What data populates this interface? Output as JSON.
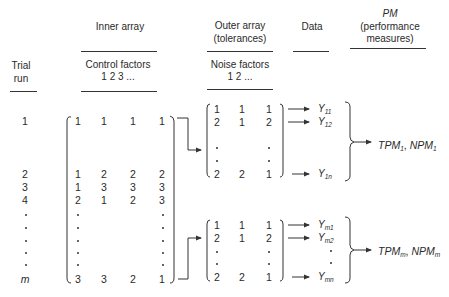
{
  "headers": {
    "inner_array": "Inner array",
    "outer_array_line1": "Outer array",
    "outer_array_line2": "(tolerances)",
    "data": "Data",
    "pm_line1": "PM",
    "pm_line2": "(performance",
    "pm_line3": "measures)",
    "trial_line1": "Trial",
    "trial_line2": "run",
    "control_factors": "Control factors",
    "control_factors_indices": "1 2 3 ...",
    "noise_factors": "Noise factors",
    "noise_factors_indices": "1 2 ..."
  },
  "trial_runs": [
    "1",
    "2",
    "3",
    "4",
    "m"
  ],
  "inner_array": {
    "rows": [
      [
        "1",
        "1",
        "1",
        "1"
      ],
      [
        "1",
        "2",
        "2",
        "2"
      ],
      [
        "1",
        "3",
        "3",
        "3"
      ],
      [
        "2",
        "1",
        "2",
        "3"
      ],
      [
        "3",
        "3",
        "2",
        "1"
      ]
    ]
  },
  "outer_array_1": {
    "rows": [
      [
        "1",
        "1",
        "1"
      ],
      [
        "2",
        "1",
        "2"
      ],
      [
        "2",
        "2",
        "1"
      ]
    ]
  },
  "outer_array_m": {
    "rows": [
      [
        "1",
        "1",
        "1"
      ],
      [
        "2",
        "1",
        "2"
      ],
      [
        "2",
        "2",
        "1"
      ]
    ]
  },
  "data_1": [
    {
      "base": "Y",
      "sub": "11"
    },
    {
      "base": "Y",
      "sub": "12"
    },
    {
      "base": "Y",
      "sub": "1n"
    }
  ],
  "data_m": [
    {
      "base": "Y",
      "sub": "m1"
    },
    {
      "base": "Y",
      "sub": "m2"
    },
    {
      "base": "Y",
      "sub": "mn"
    }
  ],
  "pm_1": {
    "tpm": "TPM",
    "tpm_sub": "1",
    "sep": ", ",
    "npm": "NPM",
    "npm_sub": "1"
  },
  "pm_m": {
    "tpm": "TPM",
    "tpm_sub": "m",
    "sep": ", ",
    "npm": "NPM",
    "npm_sub": "m"
  }
}
